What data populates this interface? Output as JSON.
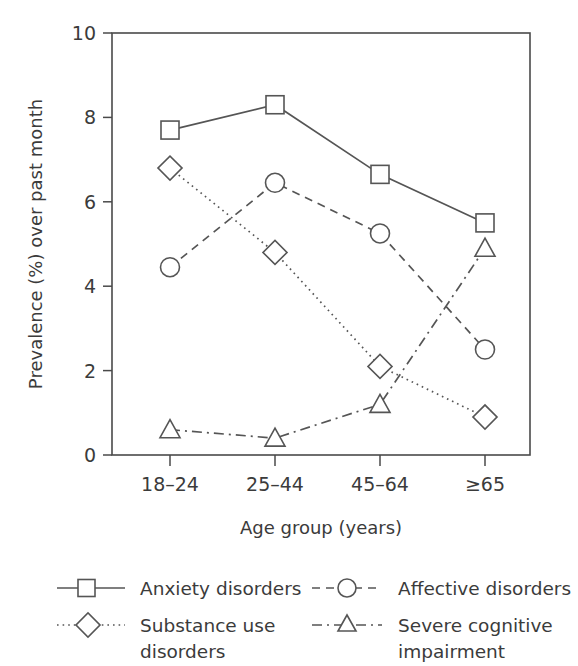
{
  "chart_data": {
    "type": "line",
    "title": "",
    "xlabel": "Age group (years)",
    "ylabel": "Prevalence (%) over past month",
    "categories": [
      "18–24",
      "25–44",
      "45–64",
      "≥65"
    ],
    "ylim": [
      0,
      10
    ],
    "yticks": [
      0,
      2,
      4,
      6,
      8,
      10
    ],
    "ytick_labels": [
      "0",
      "2",
      "4",
      "6",
      "8",
      "10"
    ],
    "grid": false,
    "legend_position": "below",
    "series": [
      {
        "name": "Anxiety disorders",
        "marker": "square",
        "linestyle": "solid",
        "values": [
          7.7,
          8.3,
          6.65,
          5.5
        ]
      },
      {
        "name": "Substance use disorders",
        "marker": "diamond",
        "linestyle": "dotted",
        "values": [
          6.8,
          4.8,
          2.1,
          0.9
        ]
      },
      {
        "name": "Affective disorders",
        "marker": "circle",
        "linestyle": "dashed",
        "values": [
          4.45,
          6.45,
          5.25,
          2.5
        ]
      },
      {
        "name": "Severe cognitive impairment",
        "marker": "triangle",
        "linestyle": "dashdot",
        "values": [
          0.6,
          0.4,
          1.2,
          4.9
        ]
      }
    ],
    "colors": {
      "line": "#555555",
      "axis": "#4a4a4a",
      "text": "#3b3b3b",
      "background": "#ffffff",
      "marker_fill": "#ffffff"
    }
  },
  "legend": {
    "entries": [
      {
        "label": "Anxiety disorders",
        "marker": "square",
        "linestyle": "solid"
      },
      {
        "label_line1": "Substance use",
        "label_line2": "disorders",
        "marker": "diamond",
        "linestyle": "dotted"
      },
      {
        "label": "Affective disorders",
        "marker": "circle",
        "linestyle": "dashed"
      },
      {
        "label_line1": "Severe cognitive",
        "label_line2": "impairment",
        "marker": "triangle",
        "linestyle": "dashdot"
      }
    ]
  },
  "axes": {
    "x_title": "Age group (years)",
    "y_title": "Prevalence (%) over past month",
    "x_tick_labels": [
      "18–24",
      "25–44",
      "45–64",
      "≥65"
    ],
    "y_tick_labels": [
      "0",
      "2",
      "4",
      "6",
      "8",
      "10"
    ]
  }
}
